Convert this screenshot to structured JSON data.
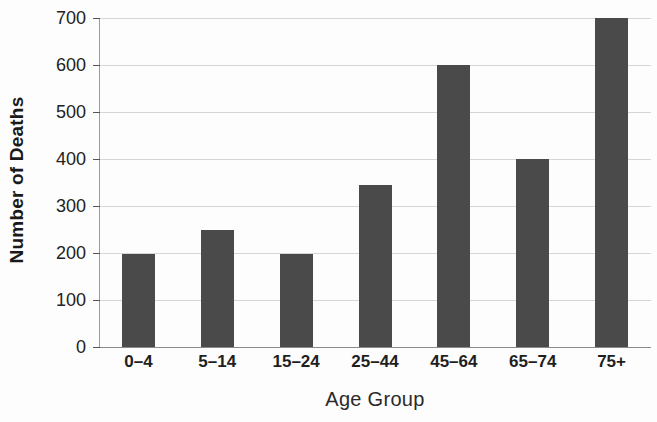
{
  "chart_data": {
    "type": "bar",
    "title": "",
    "xlabel": "Age Group",
    "ylabel": "Number of Deaths",
    "categories": [
      "0–4",
      "5–14",
      "15–24",
      "25–44",
      "45–64",
      "65–74",
      "75+"
    ],
    "values": [
      198,
      250,
      198,
      345,
      600,
      400,
      700
    ],
    "ylim": [
      0,
      700
    ],
    "yticks": [
      0,
      100,
      200,
      300,
      400,
      500,
      600,
      700
    ],
    "ytick_labels": [
      "0",
      "100",
      "200",
      "300",
      "400",
      "500",
      "600",
      "700"
    ],
    "grid": true,
    "legend": null,
    "bar_color": "#4a4a4a",
    "background_color": "#fdfdfd",
    "gridline_color": "#d6d6d6",
    "axis_color": "#9a9a9a"
  }
}
